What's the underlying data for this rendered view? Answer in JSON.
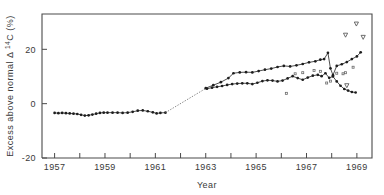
{
  "chart_data": {
    "type": "line",
    "title": "",
    "xlabel": "Year",
    "ylabel": "Excess above normal Δ¹⁴C (%)",
    "xlim": [
      1956.5,
      1969.6
    ],
    "ylim": [
      -20,
      33
    ],
    "grid": false,
    "legend": "none",
    "y_ticks": [
      20,
      0,
      -20
    ],
    "y_tick_labels": [
      "20",
      "0",
      "-20"
    ],
    "x_ticks": [
      1957,
      1958,
      1959,
      1960,
      1961,
      1962,
      1963,
      1964,
      1965,
      1966,
      1967,
      1968,
      1969
    ],
    "x_tick_labels": [
      "1957",
      "",
      "1959",
      "",
      "1961",
      "",
      "1963",
      "",
      "1965",
      "",
      "1967",
      "",
      "1969"
    ],
    "series": [
      {
        "name": "lower-record",
        "marker": "filled-circle",
        "linestyle": "solid",
        "points": [
          [
            1957.0,
            -3.4
          ],
          [
            1957.15,
            -3.5
          ],
          [
            1957.3,
            -3.4
          ],
          [
            1957.45,
            -3.5
          ],
          [
            1957.6,
            -3.6
          ],
          [
            1957.75,
            -3.7
          ],
          [
            1957.9,
            -3.8
          ],
          [
            1958.05,
            -4.1
          ],
          [
            1958.2,
            -4.4
          ],
          [
            1958.35,
            -4.3
          ],
          [
            1958.5,
            -4.0
          ],
          [
            1958.65,
            -3.7
          ],
          [
            1958.8,
            -3.4
          ],
          [
            1958.95,
            -3.3
          ],
          [
            1959.1,
            -3.3
          ],
          [
            1959.3,
            -3.3
          ],
          [
            1959.5,
            -3.3
          ],
          [
            1959.7,
            -3.4
          ],
          [
            1959.9,
            -3.3
          ],
          [
            1960.1,
            -3.0
          ],
          [
            1960.3,
            -2.6
          ],
          [
            1960.5,
            -2.5
          ],
          [
            1960.7,
            -2.8
          ],
          [
            1960.9,
            -3.2
          ],
          [
            1961.05,
            -3.6
          ],
          [
            1961.2,
            -3.4
          ],
          [
            1961.4,
            -3.3
          ]
        ]
      },
      {
        "name": "lower-record-continued",
        "marker": "filled-circle",
        "linestyle": "solid",
        "points": [
          [
            1963.05,
            5.5
          ],
          [
            1963.25,
            5.9
          ],
          [
            1963.45,
            6.2
          ],
          [
            1963.65,
            6.5
          ],
          [
            1963.85,
            6.9
          ],
          [
            1964.05,
            7.2
          ],
          [
            1964.25,
            7.4
          ],
          [
            1964.45,
            7.5
          ],
          [
            1964.65,
            7.5
          ],
          [
            1964.85,
            7.2
          ],
          [
            1965.05,
            7.7
          ],
          [
            1965.25,
            8.3
          ],
          [
            1965.45,
            8.6
          ],
          [
            1965.65,
            8.5
          ],
          [
            1965.85,
            8.2
          ],
          [
            1966.05,
            8.5
          ],
          [
            1966.25,
            9.3
          ],
          [
            1966.45,
            10.1
          ],
          [
            1966.65,
            9.4
          ],
          [
            1966.85,
            8.8
          ],
          [
            1967.05,
            9.6
          ],
          [
            1967.25,
            10.3
          ],
          [
            1967.45,
            10.6
          ],
          [
            1967.6,
            10.1
          ],
          [
            1967.75,
            11.2
          ],
          [
            1967.9,
            9.5
          ],
          [
            1968.05,
            10.0
          ],
          [
            1968.2,
            8.2
          ],
          [
            1968.35,
            6.6
          ],
          [
            1968.5,
            5.4
          ],
          [
            1968.65,
            4.8
          ],
          [
            1968.8,
            4.3
          ],
          [
            1968.95,
            4.1
          ]
        ]
      },
      {
        "name": "upper-record",
        "marker": "filled-circle",
        "linestyle": "solid",
        "points": [
          [
            1963.0,
            5.7
          ],
          [
            1963.3,
            6.8
          ],
          [
            1963.6,
            7.9
          ],
          [
            1963.9,
            9.4
          ],
          [
            1964.1,
            11.2
          ],
          [
            1964.35,
            11.5
          ],
          [
            1964.6,
            11.6
          ],
          [
            1964.85,
            11.5
          ],
          [
            1965.1,
            12.0
          ],
          [
            1965.35,
            12.5
          ],
          [
            1965.6,
            12.9
          ],
          [
            1965.85,
            13.5
          ],
          [
            1966.1,
            13.9
          ],
          [
            1966.35,
            13.7
          ],
          [
            1966.6,
            14.1
          ],
          [
            1966.85,
            14.6
          ],
          [
            1967.1,
            15.2
          ],
          [
            1967.35,
            15.6
          ],
          [
            1967.55,
            16.2
          ],
          [
            1967.7,
            16.4
          ],
          [
            1967.85,
            18.7
          ],
          [
            1967.95,
            13.0
          ],
          [
            1968.05,
            10.5
          ],
          [
            1968.2,
            13.9
          ],
          [
            1968.4,
            14.5
          ],
          [
            1968.6,
            15.3
          ],
          [
            1968.8,
            16.4
          ],
          [
            1969.0,
            17.4
          ],
          [
            1969.15,
            18.9
          ]
        ]
      },
      {
        "name": "interpolated-gap",
        "marker": "none",
        "linestyle": "dotted",
        "points": [
          [
            1961.4,
            -3.3
          ],
          [
            1963.0,
            5.6
          ]
        ]
      }
    ],
    "scatter_markers": [
      {
        "name": "open-triangle-down",
        "symbol": "∇",
        "points": [
          [
            1968.55,
            25.2
          ],
          [
            1968.98,
            29.3
          ],
          [
            1969.25,
            24.4
          ],
          [
            1968.6,
            6.6
          ]
        ]
      },
      {
        "name": "small-open-square",
        "symbol": "□",
        "points": [
          [
            1966.2,
            3.8
          ],
          [
            1966.55,
            11.0
          ],
          [
            1966.85,
            11.4
          ],
          [
            1967.3,
            12.2
          ],
          [
            1967.55,
            11.9
          ],
          [
            1967.8,
            7.6
          ],
          [
            1967.95,
            8.3
          ],
          [
            1968.2,
            11.2
          ],
          [
            1968.45,
            11.0
          ],
          [
            1968.55,
            11.4
          ],
          [
            1968.85,
            13.4
          ]
        ]
      }
    ]
  }
}
